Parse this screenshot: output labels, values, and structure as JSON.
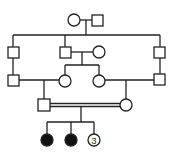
{
  "diagram": {
    "type": "pedigree",
    "stroke_color": "#222222",
    "fill_affected": "#111111",
    "generations": [
      {
        "level": "I",
        "members": [
          "female",
          "male"
        ]
      },
      {
        "level": "II",
        "members": [
          "male",
          "male",
          "female",
          "male"
        ]
      },
      {
        "level": "III",
        "members": [
          "male",
          "female",
          "female",
          "male"
        ]
      },
      {
        "level": "IV",
        "members": [
          "male",
          "female"
        ],
        "consanguineous": true
      },
      {
        "level": "V",
        "members": [
          "affected-female",
          "affected-female",
          "unaffected-females-3"
        ]
      }
    ],
    "offspring_count_label": "3"
  }
}
